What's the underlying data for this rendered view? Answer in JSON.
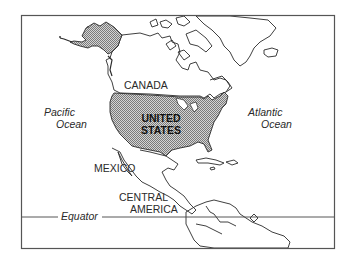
{
  "map": {
    "title": "North America",
    "colors": {
      "frame": "#555555",
      "coast": "#2a2a2a",
      "highlight_fill": "#b8b8b8",
      "background": "#ffffff"
    },
    "labels": {
      "canada": "CANADA",
      "us_line1": "UNITED",
      "us_line2": "STATES",
      "mexico": "MEXICO",
      "central_line1": "CENTRAL",
      "central_line2": "AMERICA",
      "pacific_line1": "Pacific",
      "pacific_line2": "Ocean",
      "atlantic_line1": "Atlantic",
      "atlantic_line2": "Ocean",
      "equator": "Equator"
    },
    "highlighted_region": "United States"
  }
}
